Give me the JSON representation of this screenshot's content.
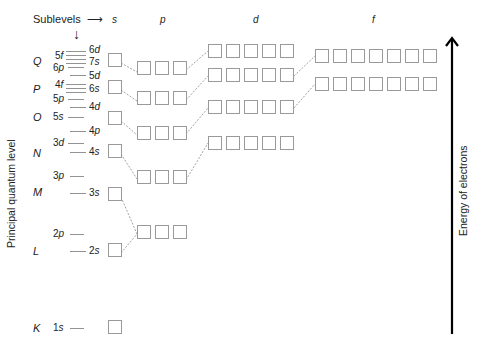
{
  "header": {
    "sublevels_label": "Sublevels",
    "right_arrow": "⟶",
    "down_arrow": "↓"
  },
  "columns": [
    {
      "label": "s",
      "x": 112
    },
    {
      "label": "p",
      "x": 160
    },
    {
      "label": "d",
      "x": 253
    },
    {
      "label": "f",
      "x": 372
    }
  ],
  "axis_labels": {
    "left": "Principal quantum level",
    "right": "Energy of electrons"
  },
  "principal_levels": [
    {
      "label": "Q",
      "y": 56
    },
    {
      "label": "P",
      "y": 84
    },
    {
      "label": "O",
      "y": 112
    },
    {
      "label": "N",
      "y": 148
    },
    {
      "label": "M",
      "y": 187
    },
    {
      "label": "L",
      "y": 246
    },
    {
      "label": "K",
      "y": 323
    }
  ],
  "sublevel_labels": [
    {
      "text": "5f",
      "x": 55,
      "y": 51
    },
    {
      "text": "6p",
      "x": 53,
      "y": 63
    },
    {
      "text": "6d",
      "x": 89,
      "y": 45
    },
    {
      "text": "7s",
      "x": 89,
      "y": 57
    },
    {
      "text": "5d",
      "x": 89,
      "y": 71
    },
    {
      "text": "4f",
      "x": 55,
      "y": 80
    },
    {
      "text": "6s",
      "x": 89,
      "y": 84
    },
    {
      "text": "5p",
      "x": 53,
      "y": 94
    },
    {
      "text": "4d",
      "x": 89,
      "y": 102
    },
    {
      "text": "5s",
      "x": 53,
      "y": 112
    },
    {
      "text": "4p",
      "x": 89,
      "y": 126
    },
    {
      "text": "3d",
      "x": 53,
      "y": 138
    },
    {
      "text": "4s",
      "x": 89,
      "y": 147
    },
    {
      "text": "3p",
      "x": 53,
      "y": 171
    },
    {
      "text": "3s",
      "x": 89,
      "y": 188
    },
    {
      "text": "2p",
      "x": 53,
      "y": 229
    },
    {
      "text": "2s",
      "x": 89,
      "y": 246
    },
    {
      "text": "1s",
      "x": 53,
      "y": 323
    }
  ],
  "level_ticks": [
    {
      "x1": 66,
      "x2": 86,
      "y": 51
    },
    {
      "x1": 66,
      "x2": 86,
      "y": 55
    },
    {
      "x1": 66,
      "x2": 86,
      "y": 59
    },
    {
      "x1": 66,
      "x2": 86,
      "y": 63
    },
    {
      "x1": 68,
      "x2": 84,
      "y": 67
    },
    {
      "x1": 70,
      "x2": 86,
      "y": 75
    },
    {
      "x1": 66,
      "x2": 86,
      "y": 84
    },
    {
      "x1": 66,
      "x2": 86,
      "y": 88
    },
    {
      "x1": 66,
      "x2": 86,
      "y": 92
    },
    {
      "x1": 68,
      "x2": 84,
      "y": 99
    },
    {
      "x1": 70,
      "x2": 86,
      "y": 107
    },
    {
      "x1": 68,
      "x2": 84,
      "y": 117
    },
    {
      "x1": 70,
      "x2": 86,
      "y": 131
    },
    {
      "x1": 68,
      "x2": 84,
      "y": 143
    },
    {
      "x1": 70,
      "x2": 86,
      "y": 152
    },
    {
      "x1": 70,
      "x2": 84,
      "y": 176
    },
    {
      "x1": 70,
      "x2": 86,
      "y": 193
    },
    {
      "x1": 70,
      "x2": 84,
      "y": 234
    },
    {
      "x1": 70,
      "x2": 86,
      "y": 251
    },
    {
      "x1": 70,
      "x2": 84,
      "y": 328
    }
  ],
  "orbital_rows": [
    {
      "sublevel": "7s",
      "x": 108,
      "y": 53,
      "count": 1
    },
    {
      "sublevel": "6p",
      "x": 137,
      "y": 61,
      "count": 3
    },
    {
      "sublevel": "6d",
      "x": 208,
      "y": 44,
      "count": 5
    },
    {
      "sublevel": "5f",
      "x": 315,
      "y": 49,
      "count": 7
    },
    {
      "sublevel": "6s",
      "x": 108,
      "y": 80,
      "count": 1
    },
    {
      "sublevel": "5p",
      "x": 137,
      "y": 91,
      "count": 3
    },
    {
      "sublevel": "5d",
      "x": 208,
      "y": 68,
      "count": 5
    },
    {
      "sublevel": "4f",
      "x": 315,
      "y": 77,
      "count": 7
    },
    {
      "sublevel": "5s",
      "x": 108,
      "y": 111,
      "count": 1
    },
    {
      "sublevel": "4p",
      "x": 137,
      "y": 126,
      "count": 3
    },
    {
      "sublevel": "4d",
      "x": 208,
      "y": 100,
      "count": 5
    },
    {
      "sublevel": "4s",
      "x": 108,
      "y": 144,
      "count": 1
    },
    {
      "sublevel": "3p",
      "x": 137,
      "y": 170,
      "count": 3
    },
    {
      "sublevel": "3d",
      "x": 208,
      "y": 136,
      "count": 5
    },
    {
      "sublevel": "3s",
      "x": 108,
      "y": 187,
      "count": 1
    },
    {
      "sublevel": "2p",
      "x": 137,
      "y": 225,
      "count": 3
    },
    {
      "sublevel": "2s",
      "x": 108,
      "y": 243,
      "count": 1
    },
    {
      "sublevel": "1s",
      "x": 108,
      "y": 320,
      "count": 1
    }
  ],
  "connectors": [
    {
      "x1": 121,
      "y1": 63,
      "x2": 137,
      "y2": 72
    },
    {
      "x1": 121,
      "y1": 90,
      "x2": 137,
      "y2": 101
    },
    {
      "x1": 121,
      "y1": 121,
      "x2": 137,
      "y2": 135
    },
    {
      "x1": 121,
      "y1": 154,
      "x2": 137,
      "y2": 179
    },
    {
      "x1": 121,
      "y1": 197,
      "x2": 137,
      "y2": 234
    },
    {
      "x1": 121,
      "y1": 253,
      "x2": 137,
      "y2": 234
    },
    {
      "x1": 186,
      "y1": 70,
      "x2": 208,
      "y2": 51
    },
    {
      "x1": 186,
      "y1": 100,
      "x2": 208,
      "y2": 76
    },
    {
      "x1": 186,
      "y1": 134,
      "x2": 208,
      "y2": 108
    },
    {
      "x1": 186,
      "y1": 180,
      "x2": 208,
      "y2": 143
    },
    {
      "x1": 294,
      "y1": 76,
      "x2": 315,
      "y2": 56
    },
    {
      "x1": 294,
      "y1": 108,
      "x2": 315,
      "y2": 84
    }
  ],
  "energy_arrow": {
    "x": 452,
    "y_top": 38,
    "y_bottom": 334,
    "color": "#000000"
  },
  "colors": {
    "box_border": "#9a9a9a",
    "connector": "#8a8a8a",
    "tick": "#777777",
    "text": "#222222"
  }
}
